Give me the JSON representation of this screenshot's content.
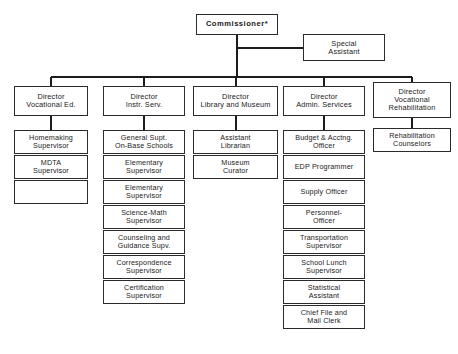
{
  "chart": {
    "type": "org-chart",
    "root": {
      "label_lines": [
        "Commissioner*"
      ],
      "label": "Commissioner*"
    },
    "staff": {
      "label_lines": [
        "Special",
        "Assistant"
      ],
      "label": "Special Assistant"
    },
    "columns": [
      {
        "head": {
          "label_lines": [
            "Director",
            "Vocational Ed."
          ],
          "label": "Director Vocational Ed."
        },
        "children": [
          {
            "label_lines": [
              "Homemaking",
              "Supervisor"
            ],
            "label": "Homemaking Supervisor"
          },
          {
            "label_lines": [
              "MDTA",
              "Supervisor"
            ],
            "label": "MDTA Supervisor"
          },
          {
            "label_lines": [
              ""
            ],
            "label": ""
          }
        ]
      },
      {
        "head": {
          "label_lines": [
            "Director",
            "Instr. Serv."
          ],
          "label": "Director Instr. Serv."
        },
        "children": [
          {
            "label_lines": [
              "General Supt.",
              "On-Base Schools"
            ],
            "label": "General Supt. On-Base Schools"
          },
          {
            "label_lines": [
              "Elementary",
              "Supervisor"
            ],
            "label": "Elementary Supervisor"
          },
          {
            "label_lines": [
              "Elementary",
              "Supervisor"
            ],
            "label": "Elementary Supervisor"
          },
          {
            "label_lines": [
              "Science-Math",
              "Supervisor"
            ],
            "label": "Science-Math Supervisor"
          },
          {
            "label_lines": [
              "Counseling and",
              "Guidance Supv."
            ],
            "label": "Counseling and Guidance Supv."
          },
          {
            "label_lines": [
              "Correspondence",
              "Supervisor"
            ],
            "label": "Correspondence Supervisor"
          },
          {
            "label_lines": [
              "Certification",
              "Supervisor"
            ],
            "label": "Certification Supervisor"
          }
        ]
      },
      {
        "head": {
          "label_lines": [
            "Director",
            "Library and Museum"
          ],
          "label": "Director Library and Museum"
        },
        "children": [
          {
            "label_lines": [
              "Assistant",
              "Librarian"
            ],
            "label": "Assistant Librarian"
          },
          {
            "label_lines": [
              "Museum",
              "Curator"
            ],
            "label": "Museum Curator"
          }
        ]
      },
      {
        "head": {
          "label_lines": [
            "Director",
            "Admin. Services"
          ],
          "label": "Director Admin. Services"
        },
        "children": [
          {
            "label_lines": [
              "Budget & Acctng.",
              "Officer"
            ],
            "label": "Budget & Acctng. Officer"
          },
          {
            "label_lines": [
              "EDP Programmer"
            ],
            "label": "EDP Programmer"
          },
          {
            "label_lines": [
              "Supply Officer"
            ],
            "label": "Supply Officer"
          },
          {
            "label_lines": [
              "Personnel-",
              "Officer"
            ],
            "label": "Personnel-Officer"
          },
          {
            "label_lines": [
              "Transportation",
              "Supervisor"
            ],
            "label": "Transportation Supervisor"
          },
          {
            "label_lines": [
              "School Lunch",
              "Supervisor"
            ],
            "label": "School Lunch Supervisor"
          },
          {
            "label_lines": [
              "Statistical",
              "Assistant"
            ],
            "label": "Statistical Assistant"
          },
          {
            "label_lines": [
              "Chief File and",
              "Mail Clerk"
            ],
            "label": "Chief File and Mail Clerk"
          }
        ]
      },
      {
        "head": {
          "label_lines": [
            "Director",
            "Vocational",
            "Rehabilitation"
          ],
          "label": "Director Vocational Rehabilitation"
        },
        "children": [
          {
            "label_lines": [
              "Rehabilitation",
              "Counselors"
            ],
            "label": "Rehabilitation Counselors"
          }
        ]
      }
    ],
    "colors": {
      "background": "#ffffff",
      "line": "#1c1c1c",
      "border": "#2b2b2b",
      "text": "#1a1a1a"
    }
  }
}
